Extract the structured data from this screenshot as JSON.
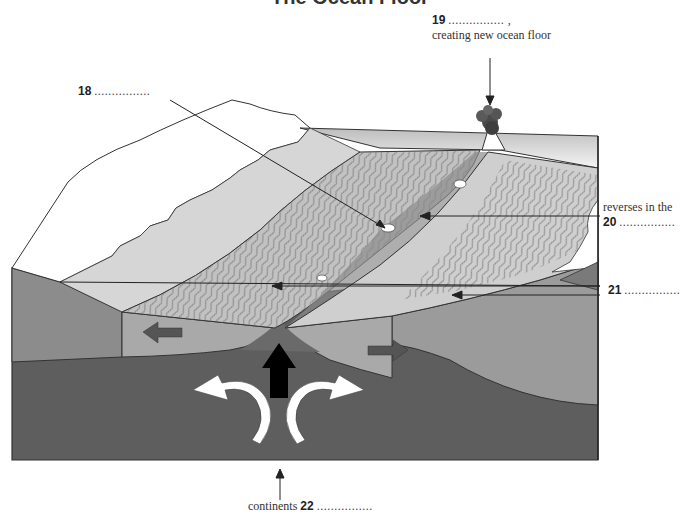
{
  "title": "The Ocean Floor",
  "labels": {
    "q18": {
      "number": "18",
      "blank": "................"
    },
    "q19": {
      "number": "19",
      "blank": "................ ,",
      "text": "creating new ocean floor"
    },
    "q20": {
      "text": "reverses in the",
      "number": "20",
      "blank": "................"
    },
    "q21": {
      "number": "21",
      "blank": "................"
    },
    "q22": {
      "text": "continents",
      "number": "22",
      "blank": "................"
    }
  },
  "colors": {
    "continent_top": "#ffffff",
    "shelf": "#d4d4d4",
    "striped_floor": "#c6c6c6",
    "ridge_dark": "#8a8a8a",
    "crust_side": "#9e9e9e",
    "mantle": "#5e5e5e",
    "sea_surface": "#e8e8e8"
  }
}
